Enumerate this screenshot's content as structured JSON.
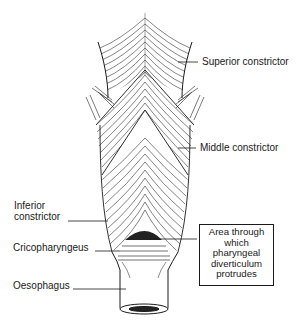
{
  "figure": {
    "colors": {
      "ink": "#1a1a1a",
      "background": "#ffffff",
      "dark_area": "#222222"
    }
  },
  "labels": {
    "superior": "Superior constrictor",
    "middle": "Middle constrictor",
    "inferior_line1": "Inferior",
    "inferior_line2": "constrictor",
    "cricopharyngeus": "Cricopharyngeus",
    "oesophagus": "Oesophagus"
  },
  "callout_box": {
    "lines": [
      "Area through",
      "which",
      "pharyngeal",
      "diverticulum",
      "protrudes"
    ]
  }
}
